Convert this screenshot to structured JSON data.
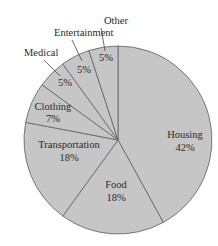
{
  "chart_data": {
    "type": "pie",
    "title": "",
    "start_angle": "12 o'clock",
    "direction": "clockwise",
    "categories": [
      "Housing",
      "Food",
      "Transportation",
      "Clothing",
      "Medical",
      "Entertainment",
      "Other"
    ],
    "values": [
      42,
      18,
      18,
      7,
      5,
      5,
      5
    ],
    "value_labels": [
      "42%",
      "18%",
      "18%",
      "7%",
      "5%",
      "5%",
      "5%"
    ],
    "colors": {
      "fill": "#c6c6c6",
      "stroke": "#6a6a6a",
      "text": "#2a2a2a"
    },
    "label_placement": {
      "inside": [
        "Housing",
        "Food",
        "Transportation",
        "Clothing"
      ],
      "outside_with_leader": [
        "Medical",
        "Entertainment",
        "Other"
      ]
    }
  }
}
